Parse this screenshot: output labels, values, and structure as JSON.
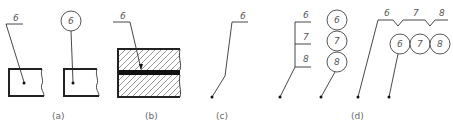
{
  "figure": {
    "panels": [
      {
        "id": "a",
        "caption": "(a)",
        "labels": [
          "6",
          "6"
        ]
      },
      {
        "id": "b",
        "caption": "(b)",
        "labels": [
          "6"
        ]
      },
      {
        "id": "c",
        "caption": "(c)",
        "labels": [
          "6"
        ]
      },
      {
        "id": "d",
        "caption": "(d)",
        "labels": [
          "6",
          "7",
          "8",
          "6",
          "7",
          "8",
          "6",
          "7",
          "8",
          "6",
          "7",
          "8"
        ]
      }
    ]
  }
}
